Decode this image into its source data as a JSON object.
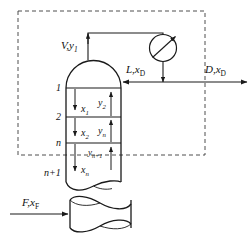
{
  "figure": {
    "type": "process-flow-diagram",
    "stroke_color": "#1a1a1a",
    "dashed_envelope_color": "#3a3a3a",
    "background": "#ffffff"
  },
  "streams": {
    "vapor_overhead": {
      "label": "V,y",
      "sub": "1",
      "full": "V,y1"
    },
    "reflux": {
      "label": "L,x",
      "sub": "D",
      "full": "L,xD"
    },
    "distillate": {
      "label": "D,x",
      "sub": "D",
      "full": "D,xD"
    },
    "feed": {
      "label": "F,x",
      "sub": "F",
      "full": "F,xF"
    }
  },
  "trays": [
    {
      "number": "1",
      "liquid": {
        "label": "x",
        "sub": "1"
      },
      "vapor": {
        "label": "y",
        "sub": "2"
      }
    },
    {
      "number": "2",
      "liquid": {
        "label": "x",
        "sub": "2"
      },
      "vapor": {
        "label": "y",
        "sub": "n"
      }
    },
    {
      "number": "n",
      "liquid": {
        "label": "x",
        "sub": "n"
      },
      "vapor": {
        "label": "y",
        "sub": "n+1"
      }
    },
    {
      "number": "n+1"
    }
  ],
  "equipment": {
    "condenser": {
      "name": "condenser",
      "symbol": "circle-with-diagonal-arrow"
    },
    "column": {
      "name": "column",
      "symbol": "domed-vessel-with-trays"
    },
    "break_symbol": {
      "name": "break",
      "symbol": "wavy-cut"
    }
  }
}
